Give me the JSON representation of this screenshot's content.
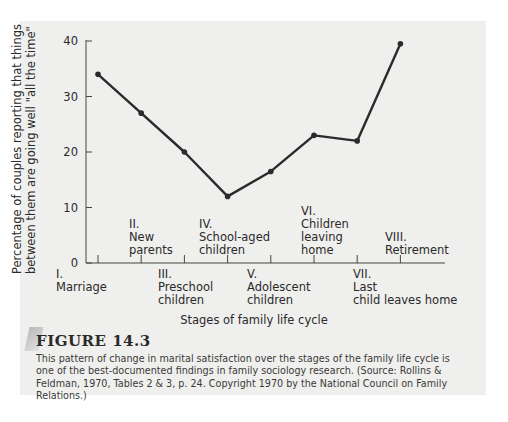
{
  "chart_data": {
    "type": "line",
    "title": "",
    "xlabel": "Stages of family life cycle",
    "ylabel": "Percentage of couples reporting that things between them are going well \"all the time\"",
    "ylim": [
      0,
      40
    ],
    "yticks": [
      0,
      10,
      20,
      30,
      40
    ],
    "grid": false,
    "categories": [
      "I. Marriage",
      "II. New parents",
      "III. Preschool children",
      "IV. School-aged children",
      "V. Adolescent children",
      "VI. Children leaving home",
      "VII. Last child leaves home",
      "VIII. Retirement"
    ],
    "values": [
      34,
      27,
      20,
      12,
      16.5,
      23,
      22,
      39.5
    ]
  },
  "axis": {
    "ylabel_line1": "Percentage of couples reporting that things",
    "ylabel_line2": "between them are going well \"all the time\"",
    "xtitle": "Stages of family life cycle",
    "yticks": [
      "40",
      "30",
      "20",
      "10",
      "0"
    ]
  },
  "stages": [
    {
      "num": "I.",
      "name1": "Marriage",
      "name2": ""
    },
    {
      "num": "II.",
      "name1": "New",
      "name2": "parents"
    },
    {
      "num": "III.",
      "name1": "Preschool",
      "name2": "children"
    },
    {
      "num": "IV.",
      "name1": "School-aged",
      "name2": "children"
    },
    {
      "num": "V.",
      "name1": "Adolescent",
      "name2": "children"
    },
    {
      "num": "VI.",
      "name1": "Children",
      "name2": "leaving",
      "name3": "home"
    },
    {
      "num": "VII.",
      "name1": "Last",
      "name2": "child leaves home"
    },
    {
      "num": "VIII.",
      "name1": "Retirement",
      "name2": ""
    }
  ],
  "figure": {
    "title": "FIGURE 14.3",
    "caption": "This pattern of change in marital satisfaction over the stages of the family life cycle is one of the best-documented findings in family sociology research. (Source: Rollins & Feldman, 1970, Tables 2 & 3, p. 24. Copyright 1970 by the National Council on Family Relations.)"
  },
  "colors": {
    "panel": "#efefed",
    "line": "#2b2b2b",
    "text": "#2a2a2a"
  }
}
